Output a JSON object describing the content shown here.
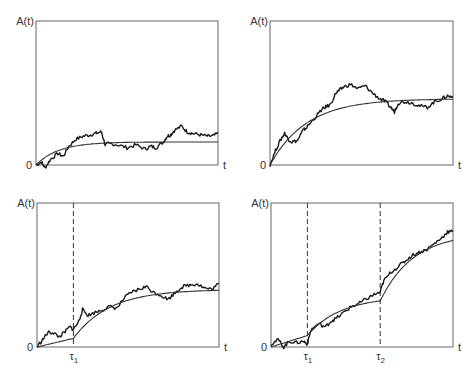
{
  "chart_data": [
    {
      "type": "line",
      "panel": "top-left",
      "ylabel": "A(t)",
      "xlabel": "t",
      "origin_label": "0",
      "box": {
        "x0": 36,
        "y0": 21,
        "x1": 218,
        "y1": 165
      },
      "events": [],
      "series": [
        {
          "name": "stochastic",
          "style": "noisy",
          "x": [
            0,
            0.03,
            0.05,
            0.08,
            0.12,
            0.15,
            0.18,
            0.22,
            0.26,
            0.3,
            0.33,
            0.36,
            0.38,
            0.4,
            0.45,
            0.5,
            0.55,
            0.6,
            0.63,
            0.66,
            0.7,
            0.72,
            0.74,
            0.76,
            0.8,
            0.83,
            0.86,
            0.9,
            0.94,
            0.97,
            1.0
          ],
          "y": [
            0.0,
            0.02,
            -0.02,
            0.04,
            0.08,
            0.06,
            0.13,
            0.18,
            0.2,
            0.21,
            0.22,
            0.23,
            0.14,
            0.15,
            0.14,
            0.12,
            0.14,
            0.11,
            0.13,
            0.12,
            0.16,
            0.2,
            0.21,
            0.24,
            0.27,
            0.23,
            0.22,
            0.21,
            0.2,
            0.2,
            0.22
          ]
        },
        {
          "name": "mean",
          "style": "smooth",
          "model": "saturating",
          "plateau": 0.16,
          "rate": 8
        }
      ]
    },
    {
      "type": "line",
      "panel": "top-right",
      "ylabel": "A(t)",
      "xlabel": "t",
      "origin_label": "0",
      "box": {
        "x0": 270,
        "y0": 21,
        "x1": 453,
        "y1": 165
      },
      "events": [],
      "series": [
        {
          "name": "stochastic",
          "style": "noisy",
          "x": [
            0,
            0.03,
            0.06,
            0.08,
            0.1,
            0.12,
            0.15,
            0.18,
            0.2,
            0.24,
            0.28,
            0.3,
            0.33,
            0.36,
            0.38,
            0.4,
            0.44,
            0.48,
            0.52,
            0.56,
            0.6,
            0.63,
            0.66,
            0.68,
            0.7,
            0.74,
            0.78,
            0.82,
            0.86,
            0.9,
            0.94,
            0.97,
            1.0
          ],
          "y": [
            0.0,
            0.1,
            0.18,
            0.22,
            0.18,
            0.16,
            0.17,
            0.24,
            0.26,
            0.32,
            0.38,
            0.4,
            0.42,
            0.5,
            0.52,
            0.54,
            0.56,
            0.53,
            0.55,
            0.5,
            0.46,
            0.44,
            0.4,
            0.37,
            0.43,
            0.44,
            0.43,
            0.41,
            0.4,
            0.44,
            0.46,
            0.48,
            0.47
          ]
        },
        {
          "name": "mean",
          "style": "smooth",
          "model": "saturating",
          "plateau": 0.46,
          "rate": 5
        }
      ]
    },
    {
      "type": "line",
      "panel": "bottom-left",
      "ylabel": "A(t)",
      "xlabel": "t",
      "origin_label": "0",
      "box": {
        "x0": 37,
        "y0": 203,
        "x1": 219,
        "y1": 347
      },
      "events": [
        {
          "label": "τ",
          "sub": "1",
          "x": 0.2
        }
      ],
      "series": [
        {
          "name": "stochastic",
          "style": "noisy",
          "x": [
            0,
            0.03,
            0.06,
            0.09,
            0.12,
            0.15,
            0.18,
            0.2,
            0.23,
            0.25,
            0.28,
            0.32,
            0.36,
            0.4,
            0.44,
            0.48,
            0.52,
            0.56,
            0.6,
            0.64,
            0.68,
            0.72,
            0.76,
            0.8,
            0.84,
            0.88,
            0.92,
            0.96,
            1.0
          ],
          "y": [
            0.0,
            0.05,
            0.1,
            0.1,
            0.07,
            0.1,
            0.14,
            0.12,
            0.18,
            0.26,
            0.22,
            0.24,
            0.26,
            0.28,
            0.27,
            0.34,
            0.38,
            0.4,
            0.42,
            0.38,
            0.36,
            0.33,
            0.38,
            0.42,
            0.43,
            0.44,
            0.41,
            0.4,
            0.44
          ]
        },
        {
          "name": "mean",
          "style": "smooth",
          "model": "piecewise",
          "pre_slope": 0.5,
          "plateau": 0.4,
          "rate": 5
        }
      ]
    },
    {
      "type": "line",
      "panel": "bottom-right",
      "ylabel": "A(t)",
      "xlabel": "t",
      "origin_label": "0",
      "box": {
        "x0": 271,
        "y0": 203,
        "x1": 453,
        "y1": 347
      },
      "events": [
        {
          "label": "τ",
          "sub": "1",
          "x": 0.2
        },
        {
          "label": "τ",
          "sub": "2",
          "x": 0.6
        }
      ],
      "series": [
        {
          "name": "stochastic",
          "style": "noisy",
          "x": [
            0,
            0.04,
            0.07,
            0.1,
            0.14,
            0.18,
            0.2,
            0.22,
            0.26,
            0.3,
            0.33,
            0.36,
            0.4,
            0.44,
            0.48,
            0.52,
            0.56,
            0.6,
            0.62,
            0.66,
            0.7,
            0.74,
            0.78,
            0.82,
            0.86,
            0.9,
            0.94,
            0.97,
            1.0
          ],
          "y": [
            0.02,
            0.05,
            0.0,
            0.04,
            0.03,
            0.04,
            0.02,
            0.12,
            0.16,
            0.14,
            0.18,
            0.2,
            0.24,
            0.28,
            0.3,
            0.33,
            0.36,
            0.38,
            0.46,
            0.52,
            0.56,
            0.6,
            0.64,
            0.66,
            0.68,
            0.72,
            0.76,
            0.8,
            0.8
          ]
        },
        {
          "name": "mean",
          "style": "smooth",
          "model": "piecewise-2",
          "knots": [
            [
              0,
              0
            ],
            [
              0.2,
              0.08
            ],
            [
              0.6,
              0.32
            ],
            [
              1.0,
              0.74
            ]
          ]
        }
      ]
    }
  ],
  "labels": {
    "ylabel": "A(t)",
    "xlabel": "t",
    "origin": "0",
    "tau": "τ",
    "tau1_sub": "1",
    "tau2_sub": "2"
  }
}
